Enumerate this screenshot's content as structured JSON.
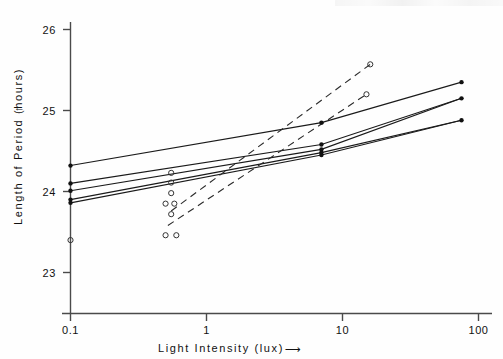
{
  "figure": {
    "background_color": "#fefefe",
    "ink_color": "#1a1a1a"
  },
  "axes": {
    "y_axis": {
      "label": "Length of Period  (hours)",
      "label_arrow": "↑",
      "scale": "linear",
      "ticks": [
        "26",
        "25",
        "24",
        "23"
      ],
      "tick_values": [
        26,
        25,
        24,
        23
      ],
      "limits": [
        22.6,
        26.1
      ]
    },
    "x_axis": {
      "label": "Light  Intensity  (lux)",
      "label_arrow": "⟶",
      "scale": "log10",
      "ticks": [
        "0.1",
        "1",
        "10",
        "100"
      ],
      "tick_values": [
        0.1,
        1,
        10,
        100
      ],
      "limits": [
        0.08,
        130
      ]
    }
  },
  "chart_data": {
    "type": "scatter",
    "title": "",
    "xlabel": "Light Intensity (lux)",
    "ylabel": "Length of Period (hours)",
    "xscale": "log",
    "yscale": "linear",
    "xlim": [
      0.08,
      130
    ],
    "ylim": [
      22.6,
      26.1
    ],
    "grid": false,
    "legend": "none",
    "markers": {
      "filled_circle": "solid line series endpoints",
      "open_circle": "dashed line series endpoints"
    },
    "series": [
      {
        "name": "solid-line-1",
        "style": "solid",
        "marker": "filled-circle",
        "points": [
          {
            "x": 0.1,
            "y": 24.32
          },
          {
            "x": 7.0,
            "y": 24.85
          },
          {
            "x": 75.0,
            "y": 25.35
          }
        ]
      },
      {
        "name": "solid-line-2",
        "style": "solid",
        "marker": "filled-circle",
        "points": [
          {
            "x": 0.1,
            "y": 24.1
          },
          {
            "x": 7.0,
            "y": 24.58
          },
          {
            "x": 75.0,
            "y": 25.15
          }
        ]
      },
      {
        "name": "solid-line-3",
        "style": "solid",
        "marker": "filled-circle",
        "points": [
          {
            "x": 0.1,
            "y": 24.01
          },
          {
            "x": 7.0,
            "y": 24.52
          },
          {
            "x": 75.0,
            "y": 25.15
          }
        ]
      },
      {
        "name": "solid-line-4",
        "style": "solid",
        "marker": "filled-circle",
        "points": [
          {
            "x": 0.1,
            "y": 23.9
          },
          {
            "x": 7.0,
            "y": 24.48
          },
          {
            "x": 75.0,
            "y": 24.88
          }
        ]
      },
      {
        "name": "solid-line-5",
        "style": "solid",
        "marker": "filled-circle",
        "points": [
          {
            "x": 0.1,
            "y": 23.86
          },
          {
            "x": 7.0,
            "y": 24.45
          },
          {
            "x": 75.0,
            "y": 24.88
          }
        ]
      },
      {
        "name": "dashed-line-1",
        "style": "dashed",
        "marker": "open-circle",
        "points": [
          {
            "x": 0.55,
            "y": 23.76
          },
          {
            "x": 16.0,
            "y": 25.57
          }
        ]
      },
      {
        "name": "dashed-line-2",
        "style": "dashed",
        "marker": "open-circle",
        "points": [
          {
            "x": 0.52,
            "y": 23.58
          },
          {
            "x": 15.0,
            "y": 25.2
          }
        ]
      }
    ],
    "scatter_open_circles": [
      {
        "x": 0.1,
        "y": 23.4
      },
      {
        "x": 0.55,
        "y": 24.23
      },
      {
        "x": 0.55,
        "y": 24.11
      },
      {
        "x": 0.55,
        "y": 23.98
      },
      {
        "x": 0.5,
        "y": 23.85
      },
      {
        "x": 0.58,
        "y": 23.85
      },
      {
        "x": 0.55,
        "y": 23.72
      },
      {
        "x": 0.5,
        "y": 23.46
      },
      {
        "x": 0.6,
        "y": 23.46
      },
      {
        "x": 16.0,
        "y": 25.57
      },
      {
        "x": 15.0,
        "y": 25.2
      }
    ],
    "scatter_filled_circles": [
      {
        "x": 0.1,
        "y": 24.32
      },
      {
        "x": 0.1,
        "y": 24.1
      },
      {
        "x": 0.1,
        "y": 24.01
      },
      {
        "x": 0.1,
        "y": 23.9
      },
      {
        "x": 0.1,
        "y": 23.86
      },
      {
        "x": 7.0,
        "y": 24.85
      },
      {
        "x": 7.0,
        "y": 24.58
      },
      {
        "x": 7.0,
        "y": 24.52
      },
      {
        "x": 7.0,
        "y": 24.48
      },
      {
        "x": 7.0,
        "y": 24.45
      },
      {
        "x": 75.0,
        "y": 25.35
      },
      {
        "x": 75.0,
        "y": 25.15
      },
      {
        "x": 75.0,
        "y": 24.88
      }
    ]
  }
}
